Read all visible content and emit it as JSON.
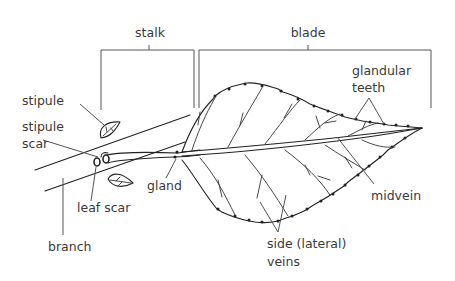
{
  "diagram": {
    "brackets": {
      "stalk": "stalk",
      "blade": "blade"
    },
    "labels": {
      "stipule": "stipule",
      "stipule_scar_line1": "stipule",
      "stipule_scar_line2": "scar",
      "glandular_teeth_line1": "glandular",
      "glandular_teeth_line2": "teeth",
      "gland": "gland",
      "leaf_scar": "leaf scar",
      "branch": "branch",
      "midvein": "midvein",
      "side_veins_line1": "side (lateral)",
      "side_veins_line2": "veins"
    },
    "colors": {
      "background": "#ffffff",
      "ink": "#222222",
      "label_text": "#3a3a3a",
      "leader_line": "#555555"
    }
  }
}
